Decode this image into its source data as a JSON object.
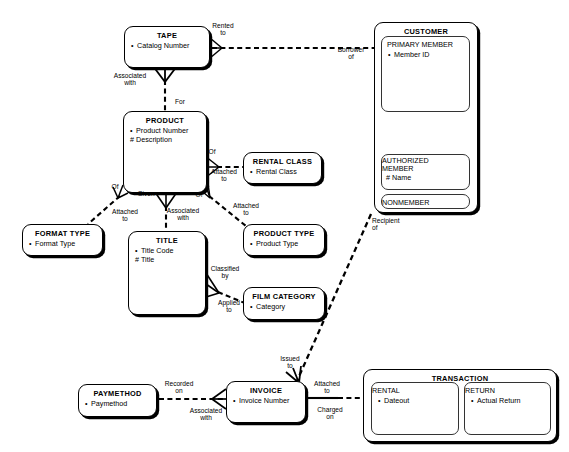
{
  "diagram": {
    "type": "entity-relationship-diagram",
    "notation": "Oracle CASE / Barker ERD",
    "width": 569,
    "height": 452,
    "background_color": "#ffffff",
    "line_color": "#000000"
  },
  "entities": [
    {
      "id": "tape",
      "name": "TAPE",
      "x": 124,
      "y": 26,
      "w": 86,
      "h": 42,
      "attributes": [
        {
          "marker": "•",
          "label": "Catalog Number"
        }
      ]
    },
    {
      "id": "product",
      "name": "PRODUCT",
      "x": 123,
      "y": 111,
      "w": 84,
      "h": 82,
      "attributes": [
        {
          "marker": "•",
          "label": "Product Number"
        },
        {
          "marker": "#",
          "label": "Description"
        }
      ]
    },
    {
      "id": "customer",
      "name": "CUSTOMER",
      "x": 374,
      "y": 22,
      "w": 104,
      "h": 191,
      "attributes": []
    },
    {
      "id": "rental_class",
      "name": "RENTAL CLASS",
      "x": 243,
      "y": 152,
      "w": 79,
      "h": 32,
      "attributes": [
        {
          "marker": "•",
          "label": "Rental Class"
        }
      ]
    },
    {
      "id": "format_type",
      "name": "FORMAT TYPE",
      "x": 22,
      "y": 224,
      "w": 81,
      "h": 32,
      "attributes": [
        {
          "marker": "•",
          "label": "Format Type"
        }
      ]
    },
    {
      "id": "title",
      "name": "TITLE",
      "x": 128,
      "y": 231,
      "w": 78,
      "h": 84,
      "attributes": [
        {
          "marker": "•",
          "label": "Title Code"
        },
        {
          "marker": "#",
          "label": "Title"
        }
      ]
    },
    {
      "id": "product_type",
      "name": "PRODUCT TYPE",
      "x": 243,
      "y": 224,
      "w": 82,
      "h": 32,
      "attributes": [
        {
          "marker": "•",
          "label": "Product Type"
        }
      ]
    },
    {
      "id": "film_category",
      "name": "FILM CATEGORY",
      "x": 243,
      "y": 287,
      "w": 82,
      "h": 33,
      "attributes": [
        {
          "marker": "•",
          "label": "Category"
        }
      ]
    },
    {
      "id": "paymethod",
      "name": "PAYMETHOD",
      "x": 78,
      "y": 384,
      "w": 79,
      "h": 33,
      "attributes": [
        {
          "marker": "•",
          "label": "Paymethod"
        }
      ]
    },
    {
      "id": "invoice",
      "name": "INVOICE",
      "x": 226,
      "y": 381,
      "w": 80,
      "h": 42,
      "attributes": [
        {
          "marker": "•",
          "label": "Invoice Number"
        }
      ]
    },
    {
      "id": "transaction",
      "name": "TRANSACTION",
      "x": 363,
      "y": 369,
      "w": 194,
      "h": 73,
      "attributes": []
    }
  ],
  "sub_entities": [
    {
      "id": "primary_member",
      "parent": "customer",
      "name": "PRIMARY MEMBER",
      "x": 381,
      "y": 36,
      "w": 89,
      "h": 76,
      "attributes": [
        {
          "marker": "•",
          "label": "Member ID"
        }
      ]
    },
    {
      "id": "authorized_member",
      "parent": "customer",
      "name": "AUTHORIZED MEMBER",
      "name_line1": "AUTHORIZED",
      "name_line2": "MEMBER",
      "x": 381,
      "y": 154,
      "w": 89,
      "h": 32,
      "attributes": [
        {
          "marker": "#",
          "label": "Name"
        }
      ]
    },
    {
      "id": "nonmember",
      "parent": "customer",
      "name": "NONMEMBER",
      "x": 381,
      "y": 192,
      "w": 89,
      "h": 16,
      "attributes": []
    },
    {
      "id": "rental",
      "parent": "transaction",
      "name": "RENTAL",
      "x": 371,
      "y": 381,
      "w": 88,
      "h": 53,
      "attributes": [
        {
          "marker": "•",
          "label": "Dateout"
        }
      ]
    },
    {
      "id": "return",
      "parent": "transaction",
      "name": "RETURN",
      "x": 464,
      "y": 381,
      "w": 87,
      "h": 53,
      "attributes": [
        {
          "marker": "•",
          "label": "Actual Return"
        }
      ]
    }
  ],
  "relationship_labels": [
    {
      "id": "rented-to",
      "lines": [
        "Rented",
        "to"
      ],
      "x": 205,
      "y": 22,
      "w": 36
    },
    {
      "id": "borrower-of",
      "lines": [
        "Borrower",
        "of"
      ],
      "x": 329,
      "y": 46,
      "w": 44
    },
    {
      "id": "associated-with-tape",
      "lines": [
        "Associated",
        "with"
      ],
      "x": 104,
      "y": 72,
      "w": 52
    },
    {
      "id": "for",
      "lines": [
        "For"
      ],
      "x": 170,
      "y": 98,
      "w": 20
    },
    {
      "id": "of-rentalclass",
      "lines": [
        "Of"
      ],
      "x": 205,
      "y": 148,
      "w": 14
    },
    {
      "id": "attached-to-rentalclass",
      "lines": [
        "Attached",
        "to"
      ],
      "x": 203,
      "y": 168,
      "w": 42
    },
    {
      "id": "of-formattype",
      "lines": [
        "Of"
      ],
      "x": 108,
      "y": 183,
      "w": 14
    },
    {
      "id": "given",
      "lines": [
        "Given"
      ],
      "x": 133,
      "y": 190,
      "w": 26
    },
    {
      "id": "of-producttype",
      "lines": [
        "Of"
      ],
      "x": 192,
      "y": 191,
      "w": 14
    },
    {
      "id": "attached-to-formattype",
      "lines": [
        "Attached",
        "to"
      ],
      "x": 104,
      "y": 208,
      "w": 42
    },
    {
      "id": "associated-with-title",
      "lines": [
        "Associated",
        "with"
      ],
      "x": 157,
      "y": 207,
      "w": 52
    },
    {
      "id": "attached-to-producttype",
      "lines": [
        "Attached",
        "to"
      ],
      "x": 225,
      "y": 202,
      "w": 42
    },
    {
      "id": "classified-by",
      "lines": [
        "Classified",
        "by"
      ],
      "x": 202,
      "y": 265,
      "w": 46
    },
    {
      "id": "applied-to",
      "lines": [
        "Applied",
        "to"
      ],
      "x": 210,
      "y": 299,
      "w": 38
    },
    {
      "id": "recipient-of",
      "lines": [
        "Recipient",
        "of"
      ],
      "x": 372,
      "y": 217,
      "w": 44
    },
    {
      "id": "issued-to",
      "lines": [
        "Issued",
        "to"
      ],
      "x": 273,
      "y": 355,
      "w": 34
    },
    {
      "id": "recorded-on",
      "lines": [
        "Recorded",
        "on"
      ],
      "x": 157,
      "y": 380,
      "w": 44
    },
    {
      "id": "associated-with-invoice",
      "lines": [
        "Associated",
        "with"
      ],
      "x": 180,
      "y": 407,
      "w": 52
    },
    {
      "id": "attached-to-transaction",
      "lines": [
        "Attached",
        "to"
      ],
      "x": 306,
      "y": 380,
      "w": 42
    },
    {
      "id": "charged-on",
      "lines": [
        "Charged",
        "on"
      ],
      "x": 310,
      "y": 406,
      "w": 40
    }
  ],
  "connections": [
    {
      "id": "tape-customer",
      "from": "TAPE",
      "to": "CUSTOMER",
      "labels": [
        "Rented to",
        "Borrower of"
      ]
    },
    {
      "id": "tape-product",
      "from": "TAPE",
      "to": "PRODUCT",
      "labels": [
        "Associated with",
        "For"
      ]
    },
    {
      "id": "product-rentalclass",
      "from": "PRODUCT",
      "to": "RENTAL CLASS",
      "labels": [
        "Of",
        "Attached to"
      ]
    },
    {
      "id": "product-formattype",
      "from": "PRODUCT",
      "to": "FORMAT TYPE",
      "labels": [
        "Of",
        "Attached to"
      ]
    },
    {
      "id": "product-title",
      "from": "PRODUCT",
      "to": "TITLE",
      "labels": [
        "Given",
        "Associated with"
      ]
    },
    {
      "id": "product-producttype",
      "from": "PRODUCT",
      "to": "PRODUCT TYPE",
      "labels": [
        "Of",
        "Attached to"
      ]
    },
    {
      "id": "title-filmcategory",
      "from": "TITLE",
      "to": "FILM CATEGORY",
      "labels": [
        "Classified by",
        "Applied to"
      ]
    },
    {
      "id": "customer-invoice",
      "from": "CUSTOMER",
      "to": "INVOICE",
      "labels": [
        "Recipient of",
        "Issued to"
      ]
    },
    {
      "id": "paymethod-invoice",
      "from": "PAYMETHOD",
      "to": "INVOICE",
      "labels": [
        "Recorded on",
        "Associated with"
      ]
    },
    {
      "id": "invoice-transaction",
      "from": "INVOICE",
      "to": "TRANSACTION",
      "labels": [
        "Attached to",
        "Charged on"
      ]
    },
    {
      "id": "primary-authorized",
      "from": "PRIMARY MEMBER",
      "to": "AUTHORIZED MEMBER",
      "labels": []
    }
  ]
}
